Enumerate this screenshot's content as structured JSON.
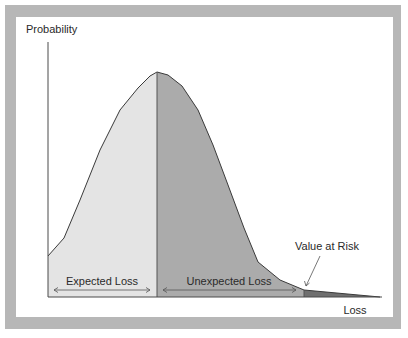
{
  "figure": {
    "y_axis_label": "Probability",
    "x_axis_label": "Loss",
    "regions": [
      {
        "name": "Expected Loss",
        "fill": "#e4e4e4"
      },
      {
        "name": "Unexpected Loss",
        "fill": "#ababab"
      },
      {
        "name": "Tail",
        "fill": "#6f6f6f"
      }
    ],
    "annotation": "Value at Risk",
    "frame_color": "#b7b7b7",
    "line_color": "#4a4a4a"
  }
}
